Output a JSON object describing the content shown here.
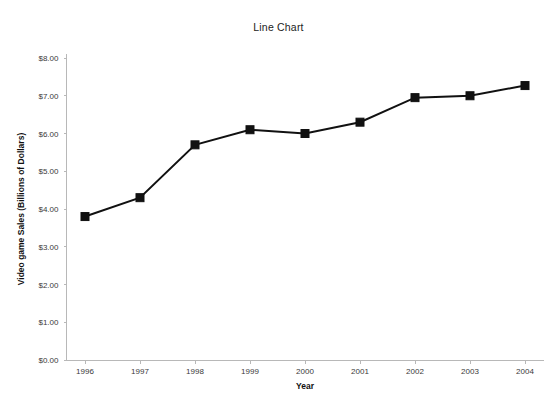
{
  "chart_data": {
    "type": "line",
    "title": "Line Chart",
    "xlabel": "Year",
    "ylabel": "Video game Sales (Billions of Dollars)",
    "categories": [
      "1996",
      "1997",
      "1998",
      "1999",
      "2000",
      "2001",
      "2002",
      "2003",
      "2004"
    ],
    "x": [
      1996,
      1997,
      1998,
      1999,
      2000,
      2001,
      2002,
      2003,
      2004
    ],
    "values": [
      3.8,
      4.3,
      5.7,
      6.1,
      6.0,
      6.3,
      6.95,
      7.0,
      7.27
    ],
    "series": [
      {
        "name": "Video game Sales",
        "values": [
          3.8,
          4.3,
          5.7,
          6.1,
          6.0,
          6.3,
          6.95,
          7.0,
          7.27
        ]
      }
    ],
    "ylim": [
      0,
      8
    ],
    "ytick_values": [
      0,
      1,
      2,
      3,
      4,
      5,
      6,
      7,
      8
    ],
    "ytick_labels": [
      "$0.00",
      "$1.00",
      "$2.00",
      "$3.00",
      "$4.00",
      "$5.00",
      "$6.00",
      "$7.00",
      "$8.00"
    ],
    "xtick_labels": [
      "1996",
      "1997",
      "1998",
      "1999",
      "2000",
      "2001",
      "2002",
      "2003",
      "2004"
    ],
    "grid": false,
    "legend": false,
    "marker": "square",
    "line_color": "#111111",
    "marker_color": "#111111",
    "axis_color": "#b8b8b8",
    "background_color": "#ffffff"
  }
}
